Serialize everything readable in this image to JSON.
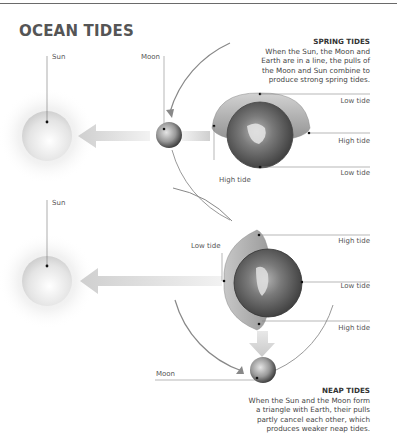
{
  "title": "OCEAN TIDES",
  "spring": {
    "heading": "SPRING TIDES",
    "lines": [
      "When the Sun, the Moon and",
      "Earth are in a line, the pulls of",
      "the Moon and Sun combine to",
      "produce strong spring tides."
    ],
    "sun_label": "Sun",
    "moon_label": "Moon",
    "tide_labels": [
      "Low tide",
      "High tide",
      "Low tide",
      "High tide"
    ]
  },
  "neap": {
    "heading": "NEAP TIDES",
    "lines": [
      "When the Sun and the Moon form",
      "a triangle with Earth, their pulls",
      "partly cancel each other, which",
      "produces weaker neap tides."
    ],
    "sun_label": "Sun",
    "moon_label": "Moon",
    "tide_labels": [
      "Low tide",
      "High tide",
      "Low tide",
      "High tide"
    ]
  },
  "colors": {
    "line": "#8a8a8a",
    "arrow": "#d8d8d8",
    "sun": "#e6e6e6",
    "bulge": "#a9a9a9",
    "earth": "#5d5d5d"
  }
}
